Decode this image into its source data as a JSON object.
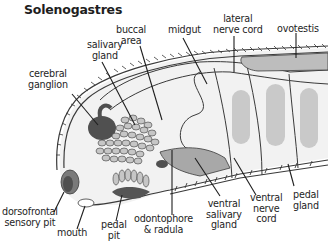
{
  "title": "Solenogastres",
  "colors": {
    "outline": "#3a3a3a",
    "body_fill": "#f2f2f2",
    "dark_organ": "#555555",
    "mid_gray": "#a9a9a9",
    "light_gray": "#c8c8c8",
    "label_text": "#1e1e1e"
  },
  "labels": {
    "salivary_gland": [
      "salivary",
      "gland"
    ],
    "buccal_area": [
      "buccal",
      "area"
    ],
    "midgut": [
      "midgut"
    ],
    "lateral_nerve_cord": [
      "lateral",
      "nerve cord"
    ],
    "ovotestis": [
      "ovotestis"
    ],
    "cerebral_ganglion": [
      "cerebral",
      "ganglion"
    ],
    "dorsofrontal_sensory_pit": [
      "dorsofrontal",
      "sensory pit"
    ],
    "mouth": [
      "mouth"
    ],
    "pedal_pit": [
      "pedal",
      "pit"
    ],
    "odontophore_radula": [
      "odontophore",
      "& radula"
    ],
    "ventral_salivary_gland": [
      "ventral",
      "salivary",
      "gland"
    ],
    "ventral_nerve_cord": [
      "ventral",
      "nerve",
      "cord"
    ],
    "pedal_gland": [
      "pedal",
      "gland"
    ]
  }
}
